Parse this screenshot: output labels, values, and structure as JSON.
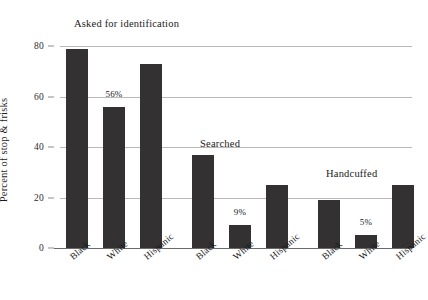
{
  "chart_data": {
    "type": "bar",
    "title": "",
    "xlabel": "",
    "ylabel": "Percent of stop & frisks",
    "ylim": [
      0,
      80
    ],
    "yticks": [
      0,
      20,
      40,
      60,
      80
    ],
    "ytick_labels": [
      "0",
      "20",
      "40",
      "60",
      "80"
    ],
    "grid": true,
    "legend": "none",
    "categories": [
      "Black",
      "White",
      "Hispanic"
    ],
    "groups": [
      {
        "name": "Asked for identification",
        "bars": [
          {
            "category": "Black",
            "value": 79,
            "label": ""
          },
          {
            "category": "White",
            "value": 56,
            "label": "56%"
          },
          {
            "category": "Hispanic",
            "value": 73,
            "label": ""
          }
        ]
      },
      {
        "name": "Searched",
        "bars": [
          {
            "category": "Black",
            "value": 37,
            "label": ""
          },
          {
            "category": "White",
            "value": 9,
            "label": "9%"
          },
          {
            "category": "Hispanic",
            "value": 25,
            "label": ""
          }
        ]
      },
      {
        "name": "Handcuffed",
        "bars": [
          {
            "category": "Black",
            "value": 19,
            "label": ""
          },
          {
            "category": "White",
            "value": 5,
            "label": "5%"
          },
          {
            "category": "Hispanic",
            "value": 25,
            "label": ""
          }
        ]
      }
    ],
    "colors": {
      "bar": "#333132",
      "gridline": "#b9b9b9",
      "axis": "#6a6a6a",
      "background": "#ffffff",
      "text": "#1a1a1a"
    }
  }
}
